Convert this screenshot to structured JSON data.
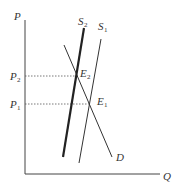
{
  "diagram": {
    "type": "supply-demand",
    "axes": {
      "y_label": "P",
      "x_label": "Q"
    },
    "price_levels": [
      {
        "label": "P",
        "sub": "2",
        "y": 76
      },
      {
        "label": "P",
        "sub": "1",
        "y": 104
      }
    ],
    "curves": [
      {
        "label": "S",
        "sub": "2",
        "weight": "thick"
      },
      {
        "label": "S",
        "sub": "1",
        "weight": "thin"
      },
      {
        "label": "D",
        "sub": "",
        "weight": "thin"
      }
    ],
    "equilibria": [
      {
        "label": "E",
        "sub": "2"
      },
      {
        "label": "E",
        "sub": "1"
      }
    ],
    "colors": {
      "line": "#333333",
      "background": "#ffffff"
    }
  }
}
